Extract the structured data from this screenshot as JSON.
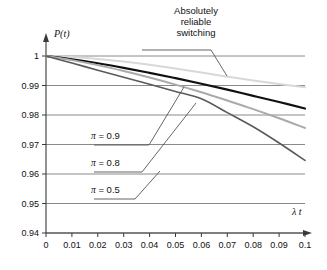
{
  "chart_data": {
    "type": "line",
    "title": "",
    "xlabel": "λ t",
    "ylabel": "P(t)",
    "xlim": [
      0,
      0.1
    ],
    "ylim": [
      0.94,
      1.0
    ],
    "grid": true,
    "legend_position": "inline-annotations",
    "xticks": [
      "0",
      "0.01",
      "0.02",
      "0.03",
      "0.04",
      "0.05",
      "0.06",
      "0.07",
      "0.08",
      "0.09",
      "0.1"
    ],
    "xtick_values": [
      0,
      0.01,
      0.02,
      0.03,
      0.04,
      0.05,
      0.06,
      0.07,
      0.08,
      0.09,
      0.1
    ],
    "yticks": [
      "1",
      "0.99",
      "0.98",
      "0.97",
      "0.96",
      "0.95",
      "0.94"
    ],
    "ytick_values": [
      1,
      0.99,
      0.98,
      0.97,
      0.96,
      0.95,
      0.94
    ],
    "x": [
      0,
      0.01,
      0.02,
      0.03,
      0.04,
      0.05,
      0.06,
      0.07,
      0.08,
      0.09,
      0.1
    ],
    "series": [
      {
        "name": "Absolutely reliable switching",
        "color": "#d8d8d8",
        "width": 2.0,
        "values": [
          1.0,
          0.99965,
          0.999,
          0.9981,
          0.997,
          0.99575,
          0.9944,
          0.993,
          0.9917,
          0.9905,
          0.9894
        ]
      },
      {
        "name": "π = 0.9",
        "color": "#101010",
        "width": 2.2,
        "values": [
          1.0,
          0.9989,
          0.99755,
          0.996,
          0.9943,
          0.9925,
          0.9906,
          0.9886,
          0.9865,
          0.9844,
          0.9822
        ]
      },
      {
        "name": "π = 0.8",
        "color": "#aaaaaa",
        "width": 2.0,
        "values": [
          1.0,
          0.9986,
          0.9969,
          0.9949,
          0.9927,
          0.9903,
          0.9877,
          0.9849,
          0.982,
          0.9789,
          0.9756
        ]
      },
      {
        "name": "π = 0.5",
        "color": "#5a5a5a",
        "width": 1.6,
        "values": [
          1.0,
          0.9976,
          0.9952,
          0.9928,
          0.9904,
          0.988,
          0.9855,
          0.9808,
          0.976,
          0.9705,
          0.9646
        ]
      }
    ],
    "annotations": [
      {
        "id": "absolutely-reliable-switching",
        "lines": [
          "Absolutely",
          "reliable",
          "switching"
        ],
        "text": "Absolutely reliable switching",
        "target_series": "Absolutely reliable switching"
      },
      {
        "id": "pi-09",
        "text": "π = 0.9",
        "symbol": "π",
        "equals": "=",
        "value": "0.9",
        "target_series": "π = 0.9"
      },
      {
        "id": "pi-08",
        "text": "π = 0.8",
        "symbol": "π",
        "equals": "=",
        "value": "0.8",
        "target_series": "π = 0.8"
      },
      {
        "id": "pi-05",
        "text": "π = 0.5",
        "symbol": "π",
        "equals": "=",
        "value": "0.5",
        "target_series": "π = 0.5"
      }
    ],
    "colors": {
      "grid": "#8a8a8a",
      "axis": "#3a3a3a",
      "text": "#111111",
      "background": "#ffffff",
      "leader": "#555555"
    }
  }
}
